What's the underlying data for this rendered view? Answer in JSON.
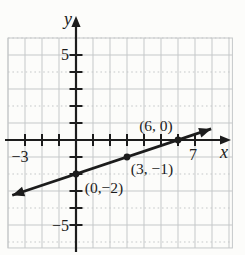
{
  "figure": {
    "background": "#fcfcfa",
    "ink_color": "#1c1c1c",
    "grid_color": "#c5c8c9"
  },
  "chart_data": {
    "type": "line",
    "title": "",
    "xlabel": "x",
    "ylabel": "y",
    "xlim": [
      -4,
      9.2
    ],
    "ylim": [
      -6.35,
      6
    ],
    "grid": true,
    "grid_step": 1,
    "points": [
      {
        "x": 0,
        "y": -2,
        "label": "(0,−2)",
        "label_dx": 28,
        "label_dy": 19
      },
      {
        "x": 3,
        "y": -1,
        "label": "(3, −1)",
        "label_dx": 25,
        "label_dy": 17
      },
      {
        "x": 6,
        "y": 0,
        "label": "(6, 0)",
        "label_dx": -22,
        "label_dy": -9
      }
    ],
    "line": {
      "slope": 0.3333,
      "intercept": -2,
      "x_start": -3.75,
      "x_end": 7.95,
      "arrows": "both"
    },
    "x_ticks": {
      "from": -3,
      "to": 7
    },
    "y_ticks": {
      "from": -5,
      "to": 5
    },
    "x_tick_labels": [
      {
        "value": -3,
        "label": "−3",
        "dx": -5,
        "dy": 22
      },
      {
        "value": 7,
        "label": "7",
        "dx": -2,
        "dy": 20
      }
    ],
    "y_tick_labels": [
      {
        "value": 5,
        "label": "5",
        "dx": -7,
        "dy": 5
      },
      {
        "value": -5,
        "label": "−5",
        "dx": -7,
        "dy": 6
      }
    ]
  }
}
